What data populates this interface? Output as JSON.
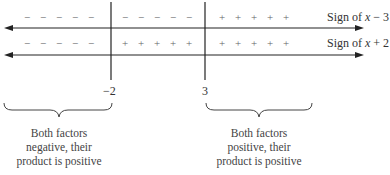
{
  "rows": [
    {
      "label_prefix": "Sign of ",
      "label_var": "x",
      "label_suffix": " − 3",
      "regions": {
        "left": [
          "−",
          "−",
          "−",
          "−",
          "−"
        ],
        "middle": [
          "−",
          "−",
          "−",
          "−",
          "−"
        ],
        "right": [
          "+",
          "+",
          "+",
          "+",
          "+"
        ]
      }
    },
    {
      "label_prefix": "Sign of ",
      "label_var": "x",
      "label_suffix": " + 2",
      "regions": {
        "left": [
          "−",
          "−",
          "−",
          "−",
          "−"
        ],
        "middle": [
          "+",
          "+",
          "+",
          "+",
          "+"
        ],
        "right": [
          "+",
          "+",
          "+",
          "+",
          "+"
        ]
      }
    }
  ],
  "critical_points": [
    "−2",
    "3"
  ],
  "captions": {
    "left": [
      "Both factors",
      "negative, their",
      "product is positive"
    ],
    "right": [
      "Both factors",
      "positive, their",
      "product is positive"
    ]
  },
  "icons": {
    "left_arrow": "arrow-left-icon",
    "right_arrow": "arrow-right-icon",
    "brace": "curly-brace-icon"
  },
  "colors": {
    "line": "#222222",
    "sign": "#666666",
    "text": "#333333"
  }
}
